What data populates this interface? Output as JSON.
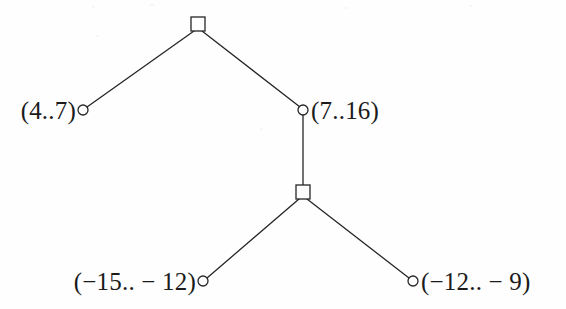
{
  "figure": {
    "width": 566,
    "height": 309,
    "background_color": "#fefefe",
    "stroke_color": "#262626",
    "text_color": "#1b1b1b"
  },
  "nodes": [
    {
      "id": "root",
      "shape": "square",
      "x": 198,
      "y": 24,
      "size": 14,
      "label": "",
      "label_side": "none"
    },
    {
      "id": "leaf-4-7",
      "shape": "circle",
      "x": 83,
      "y": 110,
      "radius": 5,
      "label": "(4..7)",
      "label_side": "left"
    },
    {
      "id": "node-7-16",
      "shape": "circle",
      "x": 303,
      "y": 110,
      "radius": 5,
      "label": "(7..16)",
      "label_side": "right"
    },
    {
      "id": "inner-square",
      "shape": "square",
      "x": 303,
      "y": 192,
      "size": 14,
      "label": "",
      "label_side": "none"
    },
    {
      "id": "leaf-neg15-neg12",
      "shape": "circle",
      "x": 203,
      "y": 281,
      "radius": 5,
      "label": "(−15.. − 12)",
      "label_side": "left"
    },
    {
      "id": "leaf-neg12-neg9",
      "shape": "circle",
      "x": 413,
      "y": 281,
      "radius": 5,
      "label": "(−12.. − 9)",
      "label_side": "right"
    }
  ],
  "edges": [
    {
      "id": "edge-root-left",
      "from": "root",
      "to": "leaf-4-7"
    },
    {
      "id": "edge-root-right",
      "from": "root",
      "to": "node-7-16"
    },
    {
      "id": "edge-node-inner",
      "from": "node-7-16",
      "to": "inner-square"
    },
    {
      "id": "edge-inner-left",
      "from": "inner-square",
      "to": "leaf-neg15-neg12"
    },
    {
      "id": "edge-inner-right",
      "from": "inner-square",
      "to": "leaf-neg12-neg9"
    }
  ],
  "labels": {
    "left_top": "(4..7)",
    "right_top": "(7..16)",
    "left_bottom": "(−15.. − 12)",
    "right_bottom": "(−12.. − 9)"
  }
}
